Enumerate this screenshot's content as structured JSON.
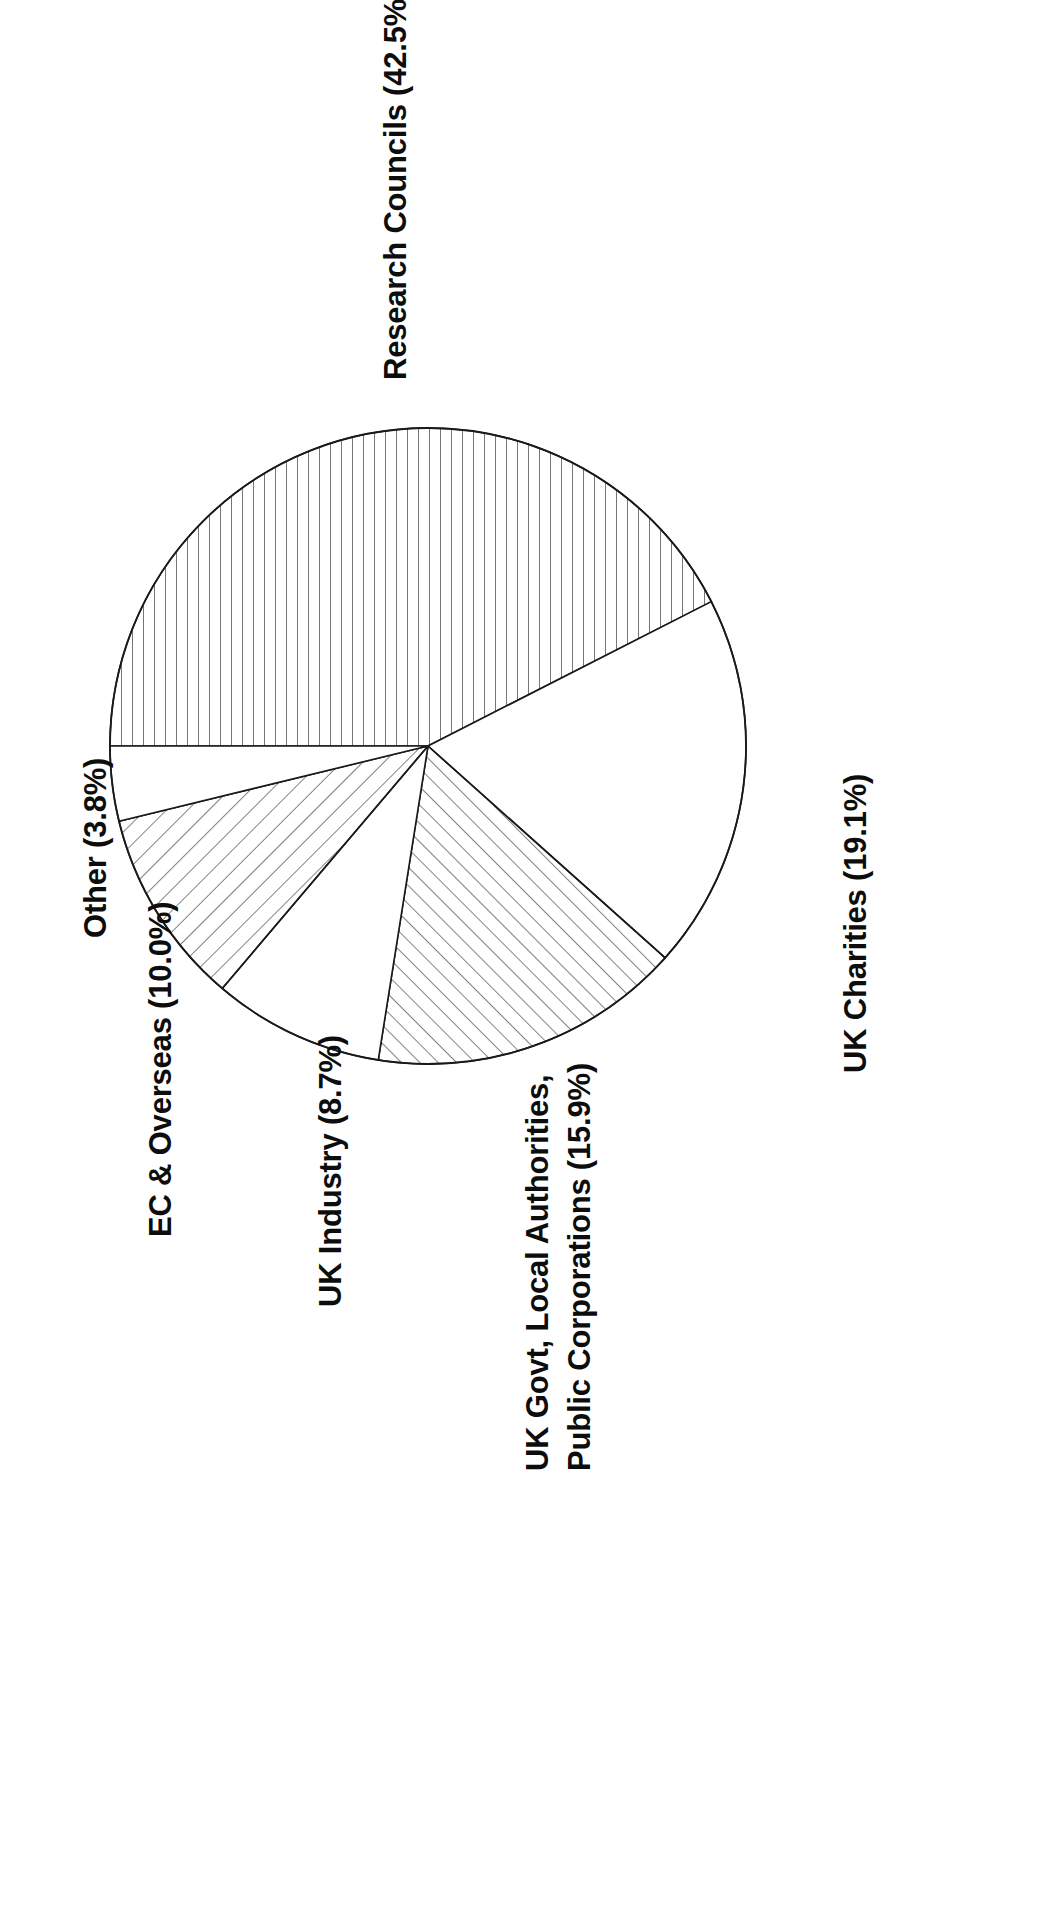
{
  "figure": {
    "name": "research-income-pie-chart",
    "orientation": "rotated-90-ccw"
  },
  "chart_data": {
    "type": "pie",
    "title": "",
    "subtitle": "",
    "xlabel": "",
    "ylabel": "",
    "grid": false,
    "legend_position": "outside-labels",
    "units": "percent",
    "start_angle_deg": 0,
    "direction": "clockwise",
    "categories": [
      "Research Councils",
      "UK Charities",
      "UK Govt, Local Authorities, Public Corporations",
      "UK Industry",
      "EC & Overseas",
      "Other"
    ],
    "values": [
      42.5,
      19.1,
      15.9,
      8.7,
      10.0,
      3.8
    ],
    "labels": [
      "Research Councils (42.5%)",
      "UK Charities (19.1%)",
      "UK Govt, Local Authorities,",
      "UK Industry (8.7%)",
      "EC & Overseas (10.0%)",
      "Other (3.8%)"
    ],
    "slices": [
      {
        "name": "research-councils",
        "label": "Research Councils (42.5%)",
        "value": 42.5,
        "hatch": "vertical-dense",
        "line_color": "#1a1a1a",
        "fill_color": "#ffffff"
      },
      {
        "name": "uk-charities",
        "label": "UK Charities (19.1%)",
        "value": 19.1,
        "hatch": "none",
        "line_color": "#1a1a1a",
        "fill_color": "#ffffff"
      },
      {
        "name": "uk-govt-local-authorities-public-corporations",
        "label": "UK Govt, Local Authorities, Public Corporations (15.9%)",
        "value": 15.9,
        "hatch": "diagonal-back",
        "line_color": "#1a1a1a",
        "fill_color": "#ffffff"
      },
      {
        "name": "uk-industry",
        "label": "UK Industry (8.7%)",
        "value": 8.7,
        "hatch": "none",
        "line_color": "#1a1a1a",
        "fill_color": "#ffffff"
      },
      {
        "name": "ec-and-overseas",
        "label": "EC & Overseas (10.0%)",
        "value": 10.0,
        "hatch": "diagonal-forward",
        "line_color": "#1a1a1a",
        "fill_color": "#ffffff"
      },
      {
        "name": "other",
        "label": "Other (3.8%)",
        "value": 3.8,
        "hatch": "none",
        "line_color": "#1a1a1a",
        "fill_color": "#ffffff"
      }
    ]
  },
  "labels": {
    "research_councils": "Research Councils (42.5%)",
    "uk_charities": "UK Charities (19.1%)",
    "uk_govt_line1": "UK Govt, Local Authorities,",
    "uk_govt_line2": "Public Corporations (15.9%)",
    "uk_industry": "UK Industry (8.7%)",
    "ec_overseas": "EC & Overseas (10.0%)",
    "other": "Other (3.8%)"
  },
  "colors": {
    "background": "#ffffff",
    "stroke": "#1a1a1a",
    "text": "#0d0d0d"
  }
}
